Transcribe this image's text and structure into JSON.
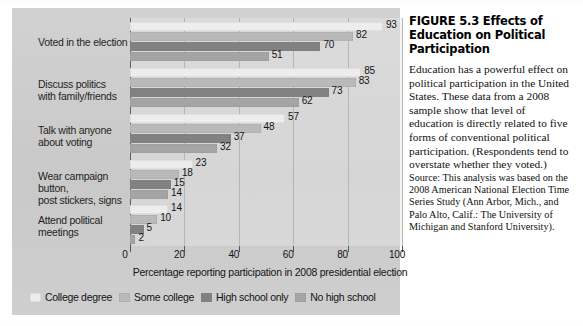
{
  "figure": {
    "caption_title": "FIGURE 5.3  Effects of Education on Political Participation",
    "caption_body": "Education has a powerful effect on political participation in the United States. These data from a 2008 sample show that level of education is directly related to five forms of conventional political participation. (Respondents tend to overstate whether they voted.)",
    "caption_source": "Source: This analysis was based on the 2008 American National Election Time Series Study (Ann Arbor, Mich., and Palo Alto, Calif.: The University of Michigan and Stanford University)."
  },
  "colors": {
    "panel": "#cdcdcd",
    "college_degree": "#eeeeee",
    "some_college": "#b9b9b9",
    "high_school_only": "#808080",
    "no_high_school": "#a4a4a4",
    "axis": "#555555",
    "gridline": "#b5b5b5",
    "text": "#111111"
  },
  "chart_data": {
    "type": "bar",
    "orientation": "horizontal",
    "title": "Effects of Education on Political Participation",
    "xlabel": "Percentage reporting participation in 2008 presidential election",
    "ylabel": "",
    "xlim": [
      0,
      100
    ],
    "xticks": [
      0,
      20,
      40,
      60,
      80,
      100
    ],
    "grid": true,
    "legend_position": "bottom",
    "categories": [
      "Voted in the election",
      "Discuss politics with family/friends",
      "Talk with anyone about voting",
      "Wear campaign button, post stickers, signs",
      "Attend political meetings"
    ],
    "category_lines": [
      [
        "Voted in the election"
      ],
      [
        "Discuss politics",
        "with family/friends"
      ],
      [
        "Talk with anyone",
        "about voting"
      ],
      [
        "Wear campaign button,",
        "post stickers, signs"
      ],
      [
        "Attend political",
        "meetings"
      ]
    ],
    "series": [
      {
        "name": "College degree",
        "color": "#eeeeee",
        "values": [
          93,
          85,
          57,
          23,
          14
        ]
      },
      {
        "name": "Some college",
        "color": "#b9b9b9",
        "values": [
          82,
          83,
          48,
          18,
          10
        ]
      },
      {
        "name": "High school only",
        "color": "#808080",
        "values": [
          70,
          73,
          37,
          15,
          5
        ]
      },
      {
        "name": "No high school",
        "color": "#a4a4a4",
        "values": [
          51,
          62,
          32,
          14,
          2
        ]
      }
    ]
  }
}
